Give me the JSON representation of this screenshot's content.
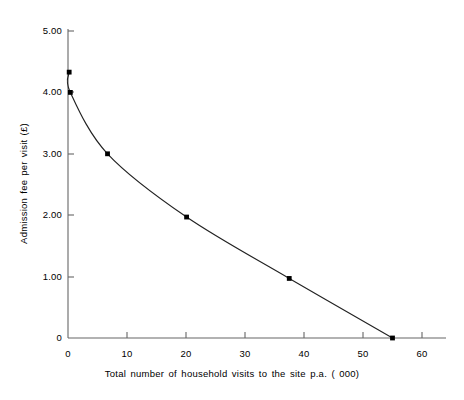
{
  "chart_data": {
    "type": "line",
    "title": "",
    "xlabel": "Total number of household visits to the site p.a. ( 000)",
    "ylabel": "Admission fee per visit (£)",
    "xlim": [
      0,
      62
    ],
    "ylim": [
      0,
      5.2
    ],
    "grid": false,
    "legend": null,
    "xticks": [
      {
        "value": 0,
        "label": "0"
      },
      {
        "value": 10,
        "label": "10"
      },
      {
        "value": 20,
        "label": "20"
      },
      {
        "value": 30,
        "label": "30"
      },
      {
        "value": 40,
        "label": "40"
      },
      {
        "value": 50,
        "label": "50"
      },
      {
        "value": 60,
        "label": "60"
      }
    ],
    "yticks": [
      {
        "value": 0,
        "label": "0"
      },
      {
        "value": 1,
        "label": "1.00"
      },
      {
        "value": 2,
        "label": "2.00"
      },
      {
        "value": 3,
        "label": "3.00"
      },
      {
        "value": 4,
        "label": "4.00"
      },
      {
        "value": 5,
        "label": "5.00"
      }
    ],
    "series": [
      {
        "name": "Demand curve",
        "marker": "square",
        "color": "#000000",
        "x": [
          0.2,
          0.4,
          6.7,
          20.1,
          37.5,
          55.0
        ],
        "y": [
          4.33,
          4.0,
          3.0,
          1.97,
          0.97,
          0.0
        ],
        "points": [
          {
            "x": 0.2,
            "y": 4.33
          },
          {
            "x": 0.4,
            "y": 4.0
          },
          {
            "x": 6.7,
            "y": 3.0
          },
          {
            "x": 20.1,
            "y": 1.97
          },
          {
            "x": 37.5,
            "y": 0.97
          },
          {
            "x": 55.0,
            "y": 0.0
          }
        ]
      }
    ],
    "axis_color": "#555555",
    "line_color": "#222222"
  }
}
